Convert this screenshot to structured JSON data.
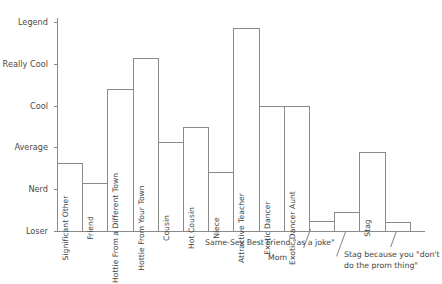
{
  "chart_data": {
    "type": "bar",
    "title": "",
    "subtitle": "",
    "xlabel": "",
    "ylabel": "",
    "grid": false,
    "legend": "none",
    "y_tick_labels": [
      "Legend",
      "Really Cool",
      "Cool",
      "Average",
      "Nerd",
      "Loser"
    ],
    "y_tick_values": [
      5,
      4,
      3,
      2,
      1,
      0
    ],
    "ylim": [
      0,
      5.25
    ],
    "categories": [
      "Significant Other",
      "Friend",
      "Hottie From a Different Town",
      "Hottie From Your Town",
      "Cousin",
      "Hot Cousin",
      "Niece",
      "Attractive Teacher",
      "Exotic Dancer",
      "Exotic Dancer Aunt",
      "Same-Sex Best Friend \"as a joke\"",
      "Mom",
      "Stag",
      "Stag because you \"don't do the prom thing\""
    ],
    "values": [
      1.62,
      1.14,
      3.4,
      4.14,
      2.12,
      2.5,
      1.4,
      4.86,
      3.0,
      3.0,
      0.24,
      0.45,
      1.9,
      0.21
    ]
  },
  "yaxis": {
    "ticks": [
      {
        "label": "Legend",
        "value": 5
      },
      {
        "label": "Really Cool",
        "value": 4
      },
      {
        "label": "Cool",
        "value": 3
      },
      {
        "label": "Average",
        "value": 2
      },
      {
        "label": "Nerd",
        "value": 1
      },
      {
        "label": "Loser",
        "value": 0
      }
    ]
  },
  "bars": [
    {
      "label": "Significant Other",
      "value": 1.62,
      "inside_label": true
    },
    {
      "label": "Friend",
      "value": 1.14,
      "inside_label": true
    },
    {
      "label": "Hottie From a Different Town",
      "value": 3.4,
      "inside_label": true
    },
    {
      "label": "Hottie From Your Town",
      "value": 4.14,
      "inside_label": true
    },
    {
      "label": "Cousin",
      "value": 2.12,
      "inside_label": true
    },
    {
      "label": "Hot Cousin",
      "value": 2.5,
      "inside_label": true
    },
    {
      "label": "Niece",
      "value": 1.4,
      "inside_label": true
    },
    {
      "label": "Attractive Teacher",
      "value": 4.86,
      "inside_label": true
    },
    {
      "label": "Exotic Dancer",
      "value": 3.0,
      "inside_label": true
    },
    {
      "label": "Exotic Dancer Aunt",
      "value": 3.0,
      "inside_label": true
    },
    {
      "label": "Same-Sex Best Friend \"as a joke\"",
      "value": 0.24,
      "inside_label": false
    },
    {
      "label": "Mom",
      "value": 0.45,
      "inside_label": false
    },
    {
      "label": "Stag",
      "value": 1.9,
      "inside_label": true
    },
    {
      "label": "Stag because you \"don't do the prom thing\"",
      "value": 0.21,
      "inside_label": false
    }
  ],
  "callouts": [
    {
      "text": "Same-Sex Best Friend \"as a joke\"",
      "line1": "Same-Sex Best Friend \"as a joke\"",
      "line2": ""
    },
    {
      "text": "Mom",
      "line1": "Mom",
      "line2": ""
    },
    {
      "text": "Stag because you \"don't do the prom thing\"",
      "line1": "Stag because you \"don't",
      "line2": "do the prom thing\""
    }
  ],
  "colors": {
    "axis": "#8a8a8a",
    "bar_stroke": "#8a8a8a",
    "bar_fill": "#ffffff",
    "text": "#3f3f3f",
    "tick_text": "#4a4a4a",
    "background": "#ffffff"
  }
}
